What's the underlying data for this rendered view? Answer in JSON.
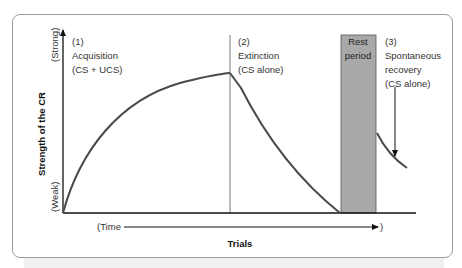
{
  "diagram": {
    "y_axis": {
      "label": "Strength of the CR",
      "top_label": "(Strong)",
      "bottom_label": "(Weak)"
    },
    "x_axis": {
      "label": "Trials",
      "time_open": "(Time",
      "time_close": ")"
    },
    "phases": [
      {
        "number": "(1)",
        "name": "Acquisition",
        "condition": "(CS + UCS)"
      },
      {
        "number": "(2)",
        "name": "Extinction",
        "condition": "(CS alone)"
      },
      {
        "number": "(3)",
        "name": "Spontaneous",
        "name2": "recovery",
        "condition": "(CS alone)"
      }
    ],
    "rest": {
      "line1": "Rest",
      "line2": "period",
      "color": "#a9a9a9"
    },
    "colors": {
      "curve": "#4a4a4a",
      "axis": "#111111",
      "frame": "#9a9a9a"
    }
  }
}
